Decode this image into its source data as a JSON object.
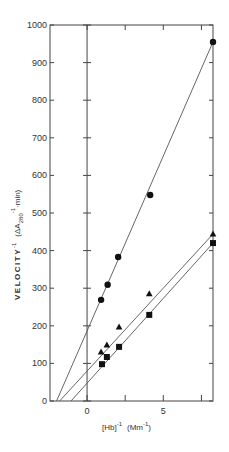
{
  "chart_data": {
    "type": "scatter",
    "title": "",
    "xlabel": "[Hb]^-1 (mM^-1)",
    "xlabel_parts": {
      "main": "[Hb]",
      "sup1": "-1",
      "unit": "(Mm",
      "sup2": "-1",
      "close": ")"
    },
    "ylabel": "VELOCITY^-1 (ΔA280^-1 · min)",
    "ylabel_parts": {
      "main": "VELOCITY",
      "sup1": "-1",
      "paren": "(ΔA",
      "sub": "280",
      "sup2": "-1",
      "rest": "·min)"
    },
    "xlim": [
      -2.43,
      8.26
    ],
    "ylim": [
      0,
      1000
    ],
    "x_ticks": [
      0,
      2.5,
      5,
      7.5
    ],
    "x_tick_labels": [
      "0",
      "",
      "5",
      ""
    ],
    "y_ticks": [
      0,
      100,
      200,
      300,
      400,
      500,
      600,
      700,
      800,
      900,
      1000
    ],
    "y_tick_labels": [
      "0",
      "100",
      "200",
      "300",
      "400",
      "500",
      "600",
      "700",
      "800",
      "900",
      "1000"
    ],
    "grid": false,
    "legend": null,
    "series": [
      {
        "name": "circles",
        "marker": "circle",
        "points": [
          [
            0.92,
            269
          ],
          [
            1.35,
            309
          ],
          [
            2.04,
            383
          ],
          [
            4.14,
            548
          ],
          [
            8.26,
            955
          ]
        ],
        "fit_line": {
          "x0": -2.0,
          "y0": 0,
          "x1": 8.26,
          "y1": 955
        }
      },
      {
        "name": "triangles",
        "marker": "triangle",
        "points": [
          [
            0.92,
            130
          ],
          [
            1.3,
            149
          ],
          [
            2.1,
            197
          ],
          [
            4.08,
            285
          ],
          [
            8.26,
            444
          ]
        ],
        "fit_line": {
          "x0": -1.8,
          "y0": 0,
          "x1": 8.26,
          "y1": 444
        }
      },
      {
        "name": "squares",
        "marker": "square",
        "points": [
          [
            0.98,
            98
          ],
          [
            1.3,
            117
          ],
          [
            2.1,
            144
          ],
          [
            4.08,
            229
          ],
          [
            8.26,
            420
          ]
        ],
        "fit_line": {
          "x0": -1.05,
          "y0": 0,
          "x1": 8.26,
          "y1": 420
        }
      }
    ]
  }
}
